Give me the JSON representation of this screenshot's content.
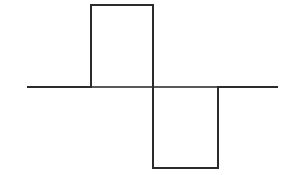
{
  "figure": {
    "background_color": "#ffffff",
    "width": 295,
    "height": 175
  },
  "axis": {
    "name": "horizontal-zero-axis",
    "color": "#5a5a5a",
    "stroke_width": 1.6,
    "x_start": 27,
    "x_end": 278,
    "y": 87
  },
  "waveform": {
    "name": "square-wave-trace",
    "color": "#2b2b2b",
    "stroke_width": 2.0,
    "baseline_y": 87,
    "positive_top_y": 5,
    "negative_bottom_y": 168,
    "rise_x": 91,
    "mid_x": 153,
    "fall_x": 218,
    "points": [
      [
        27,
        87
      ],
      [
        91,
        87
      ],
      [
        91,
        5
      ],
      [
        153,
        5
      ],
      [
        153,
        87
      ],
      [
        153,
        168
      ],
      [
        218,
        168
      ],
      [
        218,
        87
      ],
      [
        278,
        87
      ]
    ],
    "path": "M 27 87 L 91 87 L 91 5 L 153 5 L 153 168 L 218 168 L 218 87 L 278 87"
  },
  "chart_data": {
    "type": "line",
    "xlabel": "",
    "ylabel": "",
    "grid": false,
    "legend": null,
    "xlim": [
      0,
      295
    ],
    "ylim": [
      -1.2,
      1.2
    ],
    "series": [
      {
        "name": "square wave",
        "x": [
          27,
          91,
          91,
          153,
          153,
          218,
          218,
          278
        ],
        "y": [
          0,
          0,
          1,
          1,
          -1,
          -1,
          0,
          0
        ]
      }
    ],
    "annotations": [],
    "tick_labels": {
      "x": [],
      "y": []
    }
  }
}
